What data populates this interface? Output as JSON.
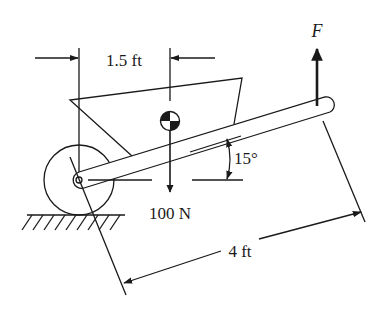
{
  "diagram": {
    "labels": {
      "top_dimension": "1.5 ft",
      "force": "F",
      "weight": "100 N",
      "angle": "15°",
      "handle_length": "4 ft"
    },
    "colors": {
      "stroke": "#1a1a1a",
      "background": "#ffffff"
    },
    "elements": [
      "wheel",
      "axle",
      "tray",
      "handle",
      "center-of-gravity-symbol",
      "weight-arrow",
      "applied-force-arrow",
      "ground-hatching",
      "angle-arc",
      "dimension-lines"
    ]
  }
}
